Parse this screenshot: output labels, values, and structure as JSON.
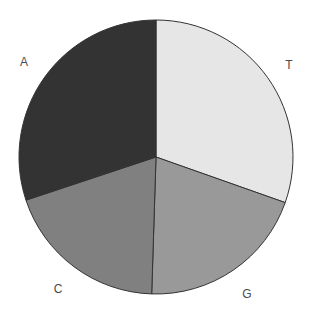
{
  "chart_data": {
    "type": "pie",
    "title": "",
    "categories": [
      "T",
      "G",
      "C",
      "A"
    ],
    "values": [
      30.4,
      20.1,
      19.4,
      30.1
    ],
    "unit": "percent (estimated from slice angles)",
    "colors": [
      "#e6e6e6",
      "#999999",
      "#808080",
      "#333333"
    ],
    "start_angle_deg": 0,
    "direction": "clockwise",
    "legend": "none",
    "labels_outside": true,
    "label_positions": {
      "T": [
        289,
        65
      ],
      "G": [
        247,
        294
      ],
      "C": [
        58,
        289
      ],
      "A": [
        24,
        62
      ]
    }
  },
  "geometry": {
    "cx": 156,
    "cy": 157,
    "r": 137,
    "stroke": "#333333"
  }
}
